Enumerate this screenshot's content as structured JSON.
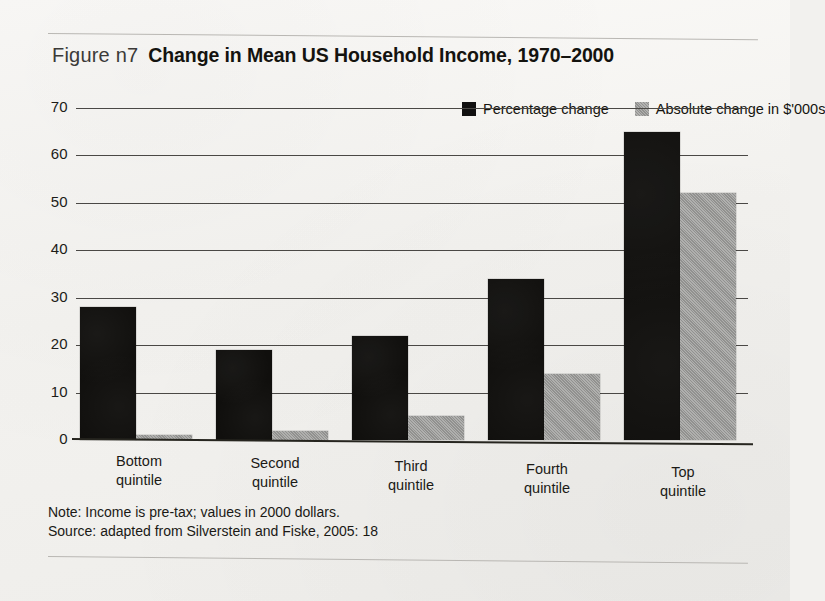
{
  "figure": {
    "label": "Figure n7",
    "title": "Change in Mean US Household Income, 1970–2000"
  },
  "legend": {
    "items": [
      {
        "label": "Percentage change",
        "color": "#111010",
        "icon": "legend-swatch-dark"
      },
      {
        "label": "Absolute change in $'000s",
        "color": "#9c9c9a",
        "icon": "legend-swatch-gray"
      }
    ]
  },
  "notes": {
    "line1": "Note: Income is pre-tax; values in 2000 dollars.",
    "line2": "Source: adapted from Silverstein and Fiske, 2005: 18"
  },
  "axis": {
    "y_ticks": [
      "0",
      "10",
      "20",
      "30",
      "40",
      "50",
      "60",
      "70"
    ]
  },
  "categories_display": [
    {
      "line1": "Bottom",
      "line2": "quintile"
    },
    {
      "line1": "Second",
      "line2": "quintile"
    },
    {
      "line1": "Third",
      "line2": "quintile"
    },
    {
      "line1": "Fourth",
      "line2": "quintile"
    },
    {
      "line1": "Top",
      "line2": "quintile"
    }
  ],
  "chart_data": {
    "type": "bar",
    "title": "Change in Mean US Household Income, 1970–2000",
    "xlabel": "",
    "ylabel": "",
    "ylim": [
      0,
      70
    ],
    "yticks": [
      0,
      10,
      20,
      30,
      40,
      50,
      60,
      70
    ],
    "grid": true,
    "legend_position": "top-right",
    "categories": [
      "Bottom quintile",
      "Second quintile",
      "Third quintile",
      "Fourth quintile",
      "Top quintile"
    ],
    "series": [
      {
        "name": "Percentage change",
        "color": "#111010",
        "values": [
          28,
          19,
          22,
          34,
          65
        ]
      },
      {
        "name": "Absolute change in $'000s",
        "color": "#9c9c9a",
        "values": [
          1,
          2,
          5,
          14,
          52
        ]
      }
    ],
    "note": "Note: Income is pre-tax; values in 2000 dollars.",
    "source": "Source: adapted from Silverstein and Fiske, 2005: 18"
  }
}
